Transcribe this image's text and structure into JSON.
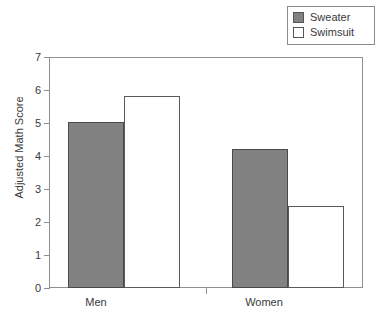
{
  "chart_data": {
    "type": "bar",
    "title": "",
    "subtitle": "",
    "xlabel": "",
    "ylabel": "Adjusted Math Score",
    "categories": [
      "Men",
      "Women"
    ],
    "series": [
      {
        "name": "Sweater",
        "values": [
          5.03,
          4.22
        ],
        "fill": "#828282",
        "swatch": "filled"
      },
      {
        "name": "Swimsuit",
        "values": [
          5.82,
          2.5
        ],
        "fill": "#ffffff",
        "swatch": "hollow"
      }
    ],
    "ylim": [
      0,
      7
    ],
    "yticks": [
      0,
      1,
      2,
      3,
      4,
      5,
      6,
      7
    ],
    "ytick_labels": [
      "0",
      "1",
      "2",
      "3",
      "4",
      "5",
      "6",
      "7"
    ],
    "grid": false,
    "legend_position": "top-right",
    "legend_entries": [
      "Sweater",
      "Swimsuit"
    ],
    "annotations": []
  },
  "legend": {
    "items": [
      {
        "label": "Sweater"
      },
      {
        "label": "Swimsuit"
      }
    ]
  },
  "axes": {
    "y_title": "Adjusted Math Score",
    "y_labels": [
      "7",
      "6",
      "5",
      "4",
      "3",
      "2",
      "1",
      "0"
    ],
    "x_labels": [
      "Men",
      "Women"
    ]
  },
  "colors": {
    "bar_fill_gray": "#828282",
    "bar_fill_white": "#ffffff",
    "bar_stroke": "#4a4a4a",
    "axis": "#8f8f8f",
    "text": "#3a3a3a",
    "background": "#ffffff"
  }
}
